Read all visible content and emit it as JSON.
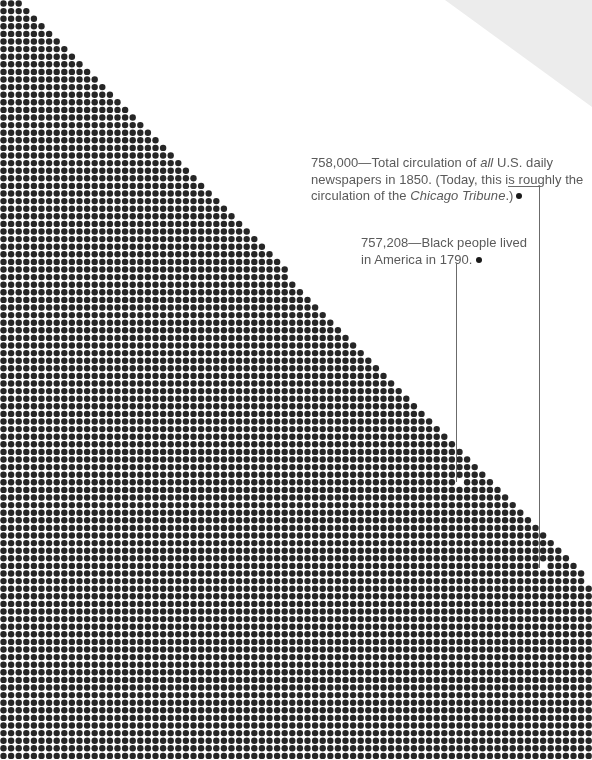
{
  "chart_data": {
    "type": "dot-matrix",
    "title": "",
    "grid": {
      "pitch_px": 7.6,
      "dot_radius_px": 3.2,
      "dot_color": "#262626",
      "rows_visible": 100,
      "edge_start_x": 22,
      "edge_slope": 0.975
    },
    "annotations": [
      {
        "value": 758000,
        "value_label": "758,000",
        "text_parts": [
          {
            "text": "758,000—Total circulation of ",
            "italic": false
          },
          {
            "text": "all",
            "italic": true
          },
          {
            "text": " U.S. daily newspapers in 1850. (Today, this is roughly the circulation of the ",
            "italic": false
          },
          {
            "text": "Chicago Tribune",
            "italic": true
          },
          {
            "text": ".)",
            "italic": false
          }
        ],
        "marker_x": 545,
        "marker_y": 565
      },
      {
        "value": 757208,
        "value_label": "757,208",
        "text_parts": [
          {
            "text": "757,208—Black people lived in America in 1790.",
            "italic": false
          }
        ],
        "marker_x": 463,
        "marker_y": 480
      }
    ]
  },
  "annotation_1": {
    "number": "758,000",
    "dash": "—",
    "t1": "Total circulation of ",
    "t2_italic": "all",
    "t3": " U.S. daily newspapers in 1850. (Today, this is roughly the circulation of the ",
    "t4_italic": "Chicago Tribune",
    "t5": ".)"
  },
  "annotation_2": {
    "number": "757,208",
    "dash": "—",
    "t1": "Black people lived in America in 1790."
  },
  "colors": {
    "dot": "#262626",
    "page_curl": "#ececec",
    "text": "#5a5a5a",
    "leader": "#6b6b6b"
  }
}
